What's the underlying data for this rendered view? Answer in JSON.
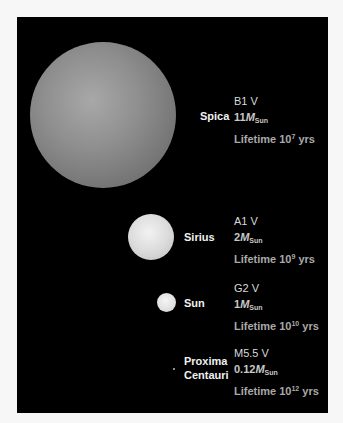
{
  "stars": [
    {
      "name": "Spica",
      "spectral_type": "B1 V",
      "mass_value": "11",
      "mass_symbol": "M",
      "mass_subscript": "Sun",
      "lifetime_prefix": "Lifetime 10",
      "lifetime_exponent": "7",
      "lifetime_unit": " yrs"
    },
    {
      "name": "Sirius",
      "spectral_type": "A1 V",
      "mass_value": "2",
      "mass_symbol": "M",
      "mass_subscript": "Sun",
      "lifetime_prefix": "Lifetime 10",
      "lifetime_exponent": "9",
      "lifetime_unit": " yrs"
    },
    {
      "name": "Sun",
      "spectral_type": "G2 V",
      "mass_value": "1",
      "mass_symbol": "M",
      "mass_subscript": "Sun",
      "lifetime_prefix": "Lifetime 10",
      "lifetime_exponent": "10",
      "lifetime_unit": " yrs"
    },
    {
      "name_line1": "Proxima",
      "name_line2": "Centauri",
      "spectral_type": "M5.5 V",
      "mass_value": "0.12",
      "mass_symbol": "M",
      "mass_subscript": "Sun",
      "lifetime_prefix": "Lifetime 10",
      "lifetime_exponent": "12",
      "lifetime_unit": " yrs"
    }
  ],
  "colors": {
    "background": "#000000",
    "frame": "#f7f7f7"
  }
}
